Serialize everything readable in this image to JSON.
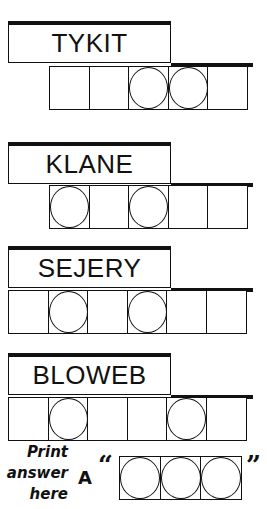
{
  "puzzles": [
    {
      "scrambled": "TYKIT",
      "cells": 5,
      "circled": [
        2,
        3
      ]
    },
    {
      "scrambled": "KLANE",
      "cells": 5,
      "circled": [
        0,
        2
      ]
    },
    {
      "scrambled": "SEJERY",
      "cells": 6,
      "circled": [
        1,
        3
      ]
    },
    {
      "scrambled": "BLOWEB",
      "cells": 6,
      "circled": [
        1,
        4
      ]
    }
  ],
  "answer": {
    "instruction_line1": "Print",
    "instruction_line2": "answer",
    "instruction_line3": "here",
    "prefix": "A",
    "open_quote": "“",
    "close_quote": "”",
    "cells": 3,
    "circled": [
      0,
      1,
      2
    ]
  },
  "colors": {
    "ink": "#111111",
    "background": "#ffffff"
  }
}
